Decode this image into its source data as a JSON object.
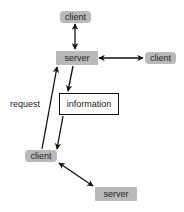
{
  "diagram": {
    "nodes": {
      "client_top": {
        "label": "client",
        "shape": "rounded-gray"
      },
      "server_top": {
        "label": "server",
        "shape": "gray-box"
      },
      "client_right": {
        "label": "client",
        "shape": "rounded-gray"
      },
      "information": {
        "label": "information",
        "shape": "outlined-box"
      },
      "client_bottom": {
        "label": "client",
        "shape": "rounded-gray"
      },
      "server_bottom": {
        "label": "server",
        "shape": "gray-box"
      }
    },
    "edge_labels": {
      "request": "request"
    },
    "edges": [
      {
        "from": "client_top",
        "to": "server_top",
        "direction": "both"
      },
      {
        "from": "server_top",
        "to": "client_right",
        "direction": "both"
      },
      {
        "from": "server_top",
        "to": "information",
        "direction": "forward"
      },
      {
        "from": "information",
        "to": "client_bottom",
        "direction": "forward"
      },
      {
        "from": "client_bottom",
        "to": "server_top",
        "direction": "forward",
        "label": "request"
      },
      {
        "from": "client_bottom",
        "to": "server_bottom",
        "direction": "both"
      }
    ],
    "colors": {
      "node_fill": "#b9b9b9",
      "line": "#111111",
      "text": "#222222"
    }
  }
}
